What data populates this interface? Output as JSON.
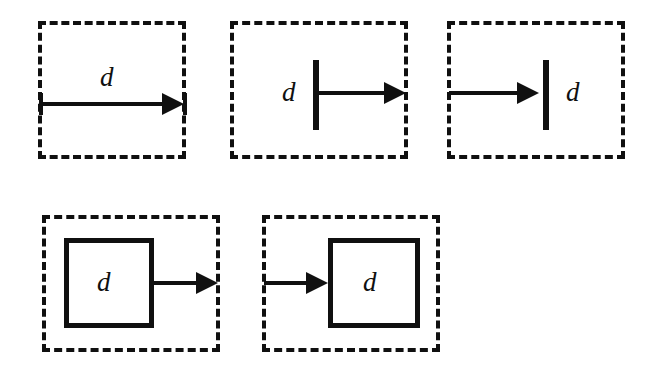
{
  "figure": {
    "title": "",
    "background_color": "#ffffff",
    "stroke_color": "#101010",
    "label_text": "d",
    "panels": [
      {
        "id": "panel-1",
        "name": "arrow-spanning-region",
        "label": "d",
        "label_position": "above-arrow-center",
        "inner_shape": "none",
        "arrow_direction": "left-to-right",
        "arrow_start": "region-left-edge",
        "arrow_end": "region-right-edge"
      },
      {
        "id": "panel-2",
        "name": "arrow-from-bar-to-right-edge",
        "label": "d",
        "label_position": "left-of-bar",
        "inner_shape": "vertical-bar",
        "arrow_direction": "left-to-right",
        "arrow_start": "vertical-bar",
        "arrow_end": "region-right-edge"
      },
      {
        "id": "panel-3",
        "name": "arrow-from-left-edge-to-bar",
        "label": "d",
        "label_position": "right-of-bar",
        "inner_shape": "vertical-bar",
        "arrow_direction": "left-to-right",
        "arrow_start": "region-left-edge",
        "arrow_end": "vertical-bar"
      },
      {
        "id": "panel-4",
        "name": "arrow-from-box-to-right-edge",
        "label": "d",
        "label_position": "inside-box",
        "inner_shape": "solid-box",
        "arrow_direction": "left-to-right",
        "arrow_start": "solid-box-right-side",
        "arrow_end": "region-right-edge"
      },
      {
        "id": "panel-5",
        "name": "arrow-from-left-edge-to-box",
        "label": "d",
        "label_position": "inside-box",
        "inner_shape": "solid-box",
        "arrow_direction": "left-to-right",
        "arrow_start": "region-left-edge",
        "arrow_end": "solid-box-left-side"
      }
    ]
  }
}
